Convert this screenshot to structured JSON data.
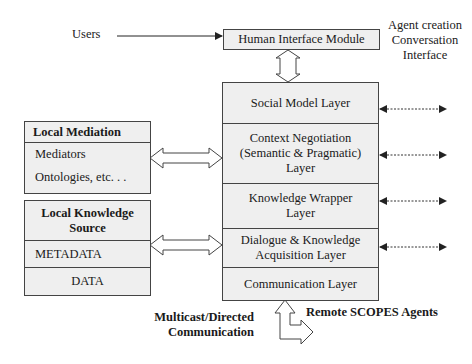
{
  "users_label": "Users",
  "agent_creation": {
    "lines": [
      "Agent creation",
      "Conversation",
      "Interface"
    ]
  },
  "human_interface_module": "Human Interface Module",
  "layers": [
    {
      "label": "Social Model  Layer"
    },
    {
      "label": "Context Negotiation (Semantic & Pragmatic) Layer",
      "lines": [
        "Context Negotiation",
        "(Semantic & Pragmatic)",
        "Layer"
      ]
    },
    {
      "label": "Knowledge Wrapper Layer",
      "lines": [
        "Knowledge Wrapper",
        "Layer"
      ]
    },
    {
      "label": "Dialogue & Knowledge Acquisition Layer",
      "lines": [
        "Dialogue & Knowledge",
        "Acquisition Layer"
      ]
    },
    {
      "label": "Communication Layer"
    }
  ],
  "local_mediation": {
    "title": "Local Mediation",
    "items": [
      "Mediators",
      "Ontologies, etc. . ."
    ]
  },
  "local_knowledge_source": {
    "title_lines": [
      "Local Knowledge",
      "Source"
    ],
    "items": [
      "METADATA",
      "DATA"
    ]
  },
  "multicast_label": {
    "lines": [
      "Multicast/Directed",
      "Communication"
    ]
  },
  "remote_agents_label": "Remote SCOPES Agents"
}
